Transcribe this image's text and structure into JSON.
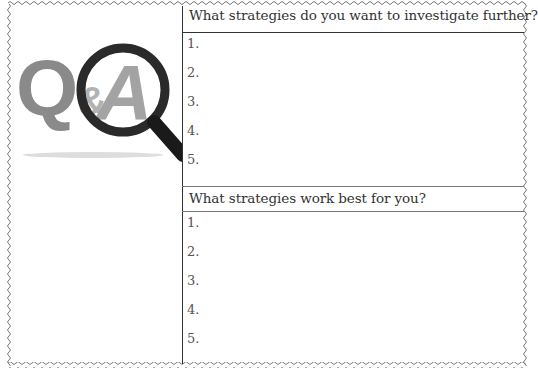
{
  "logo": {
    "text_q": "Q",
    "text_amp": "&",
    "text_a": "A",
    "icon": "magnifying-glass-icon"
  },
  "sections": [
    {
      "question": "What strategies do you want to investigate further?",
      "items": [
        "1.",
        "2.",
        "3.",
        "4.",
        "5."
      ]
    },
    {
      "question": "What strategies work best for you?",
      "items": [
        "1.",
        "2.",
        "3.",
        "4.",
        "5."
      ]
    }
  ]
}
